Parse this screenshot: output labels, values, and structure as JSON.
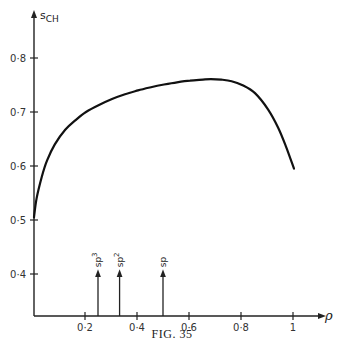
{
  "chart_data": {
    "type": "line",
    "title": "",
    "caption": "FIG. 35",
    "xlabel": "ρ",
    "ylabel": "s_CH",
    "ylabel_main": "s",
    "ylabel_sub": "CH",
    "xlim": [
      0,
      1.08
    ],
    "ylim": [
      0.33,
      0.85
    ],
    "grid": false,
    "legend": "none",
    "x_ticks": [
      {
        "value": 0.2,
        "label": "0·2"
      },
      {
        "value": 0.4,
        "label": "0·4"
      },
      {
        "value": 0.6,
        "label": "0·6"
      },
      {
        "value": 0.8,
        "label": "0·8"
      },
      {
        "value": 1.0,
        "label": "1"
      }
    ],
    "y_ticks": [
      {
        "value": 0.4,
        "label": "0·4"
      },
      {
        "value": 0.5,
        "label": "0·5"
      },
      {
        "value": 0.6,
        "label": "0·6"
      },
      {
        "value": 0.7,
        "label": "0·7"
      },
      {
        "value": 0.8,
        "label": "0·8"
      }
    ],
    "series": [
      {
        "name": "s_CH vs ρ",
        "x": [
          0.0,
          0.01,
          0.03,
          0.05,
          0.08,
          0.12,
          0.16,
          0.2,
          0.25,
          0.3,
          0.35,
          0.4,
          0.45,
          0.5,
          0.55,
          0.6,
          0.65,
          0.68,
          0.72,
          0.76,
          0.8,
          0.85,
          0.9,
          0.94,
          0.97,
          1.0
        ],
        "values": [
          0.505,
          0.54,
          0.58,
          0.61,
          0.64,
          0.667,
          0.685,
          0.7,
          0.713,
          0.724,
          0.733,
          0.74,
          0.746,
          0.751,
          0.755,
          0.758,
          0.76,
          0.761,
          0.76,
          0.757,
          0.75,
          0.735,
          0.705,
          0.67,
          0.635,
          0.595
        ]
      }
    ],
    "annotations": [
      {
        "label": "sp³",
        "base": "sp",
        "sup": "3",
        "x": 0.25,
        "y_top": 0.405,
        "type": "arrow-up"
      },
      {
        "label": "sp²",
        "base": "sp",
        "sup": "2",
        "x": 0.333,
        "y_top": 0.405,
        "type": "arrow-up"
      },
      {
        "label": "sp",
        "base": "sp",
        "sup": "",
        "x": 0.5,
        "y_top": 0.405,
        "type": "arrow-up"
      }
    ]
  }
}
